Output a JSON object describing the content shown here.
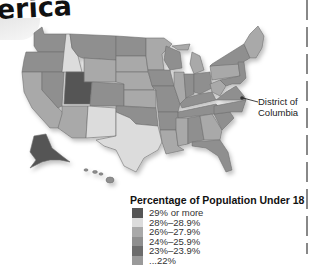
{
  "title": "erica",
  "callout": {
    "label_line1": "District of",
    "label_line2": "Columbia"
  },
  "legend": {
    "title": "Percentage of Population Under 18",
    "items": [
      {
        "label": "29% or more",
        "color": "#555555"
      },
      {
        "label": "28%–28.9%",
        "color": "#dcdcdc"
      },
      {
        "label": "26%–27.9%",
        "color": "#a9a9a9"
      },
      {
        "label": "24%–25.9%",
        "color": "#8f8f8f"
      },
      {
        "label": "23%–23.9%",
        "color": "#6c6c6c"
      },
      {
        "label": "...22%",
        "color": "#9a9a9a"
      }
    ]
  },
  "colors": {
    "utah": "#555555",
    "light": "#dcdcdc",
    "mid_light": "#a9a9a9",
    "mid": "#8f8f8f",
    "dark": "#767676"
  }
}
